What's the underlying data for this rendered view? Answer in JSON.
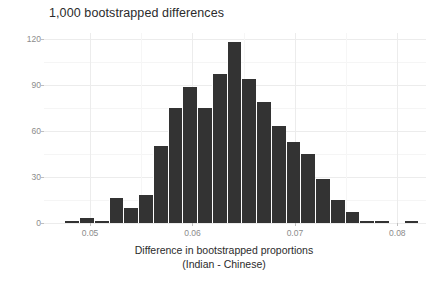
{
  "chart_data": {
    "type": "bar",
    "title": "1,000 bootstrapped differences",
    "xlabel": "Difference in bootstrapped proportions",
    "xlabel_line2": "(Indian - Chinese)",
    "ylabel": "Count",
    "xlim": [
      0.0455,
      0.0828
    ],
    "ylim": [
      0,
      124
    ],
    "grid": true,
    "legend": "none",
    "bar_color": "#333333",
    "bin_width": 0.00144,
    "bin_starts": [
      0.0475,
      0.04894,
      0.05038,
      0.05182,
      0.05326,
      0.0547,
      0.05614,
      0.05758,
      0.05902,
      0.06046,
      0.0619,
      0.06334,
      0.06478,
      0.06622,
      0.06766,
      0.0691,
      0.07054,
      0.07198,
      0.07342,
      0.07486,
      0.0763,
      0.07774,
      0.07918,
      0.08062
    ],
    "categories": [
      "0.0475",
      "0.0489",
      "0.0504",
      "0.0518",
      "0.0533",
      "0.0547",
      "0.0561",
      "0.0576",
      "0.0590",
      "0.0605",
      "0.0619",
      "0.0633",
      "0.0648",
      "0.0662",
      "0.0677",
      "0.0691",
      "0.0705",
      "0.0720",
      "0.0734",
      "0.0749",
      "0.0763",
      "0.0777",
      "0.0792",
      "0.0806"
    ],
    "values": [
      1,
      3,
      1,
      16,
      10,
      18,
      50,
      75,
      89,
      75,
      97,
      118,
      94,
      79,
      63,
      53,
      45,
      29,
      15,
      7,
      1,
      1,
      0,
      1
    ],
    "ytick_values": [
      0,
      30,
      60,
      90,
      120
    ],
    "ytick_labels": [
      "0",
      "30",
      "60",
      "90",
      "120"
    ],
    "xtick_values": [
      0.05,
      0.06,
      0.07,
      0.08
    ],
    "xtick_labels": [
      "0.05",
      "0.06",
      "0.07",
      "0.08"
    ],
    "yminor_values": [
      15,
      45,
      75,
      105
    ],
    "xminor_values": [
      0.055,
      0.065,
      0.075
    ]
  }
}
